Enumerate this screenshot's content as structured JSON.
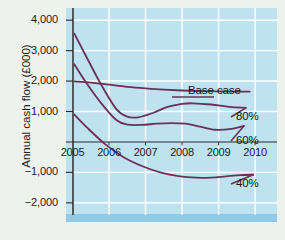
{
  "chart_data": {
    "type": "line",
    "title": "",
    "xlabel": "",
    "ylabel": "Annual cash flow (£000)",
    "xlim": [
      2005,
      2010.6
    ],
    "ylim": [
      -2400,
      4400
    ],
    "grid": true,
    "legend_position": "right-inline",
    "x_ticks": [
      "2005",
      "2006",
      "2007",
      "2008",
      "2009",
      "2010"
    ],
    "x_tick_values": [
      2005,
      2006,
      2007,
      2008,
      2009,
      2010
    ],
    "y_ticks": [
      "4,000",
      "3,000",
      "2,000",
      "1,000",
      "−1,000",
      "−2,000"
    ],
    "y_tick_values": [
      4000,
      3000,
      2000,
      1000,
      -1000,
      -2000
    ],
    "zero_line": 0,
    "line_color": "#6b3055",
    "plot_background": "#bfe2f0",
    "gridline_color": "#ffffff",
    "series": [
      {
        "name": "Base case",
        "label": "Base case",
        "x": [
          2005.05,
          2005.5,
          2006.0,
          2006.5,
          2007.0,
          2007.5,
          2008.0,
          2008.5,
          2009.0,
          2009.5,
          2009.85
        ],
        "values": [
          1990,
          1950,
          1880,
          1810,
          1760,
          1720,
          1690,
          1670,
          1660,
          1655,
          1650
        ]
      },
      {
        "name": "80%",
        "label": "80%",
        "x": [
          2005.05,
          2005.4,
          2005.8,
          2006.2,
          2006.5,
          2006.8,
          2007.2,
          2007.6,
          2008.0,
          2008.3,
          2008.8,
          2009.3,
          2009.75
        ],
        "values": [
          3560,
          2750,
          1850,
          1080,
          830,
          810,
          950,
          1150,
          1250,
          1270,
          1230,
          1150,
          1120
        ]
      },
      {
        "name": "60%",
        "label": "60%",
        "x": [
          2005.05,
          2005.4,
          2005.8,
          2006.2,
          2006.5,
          2006.9,
          2007.3,
          2007.7,
          2008.1,
          2008.5,
          2008.9,
          2009.3,
          2009.7
        ],
        "values": [
          2550,
          1900,
          1250,
          720,
          570,
          560,
          600,
          620,
          600,
          500,
          400,
          420,
          530
        ]
      },
      {
        "name": "40%",
        "label": "40%",
        "x": [
          2005.05,
          2005.4,
          2005.9,
          2006.4,
          2006.9,
          2007.4,
          2007.9,
          2008.4,
          2008.8,
          2009.2,
          2009.6,
          2009.95
        ],
        "values": [
          900,
          470,
          -80,
          -500,
          -790,
          -1000,
          -1120,
          -1175,
          -1170,
          -1130,
          -1090,
          -1075
        ]
      }
    ]
  }
}
